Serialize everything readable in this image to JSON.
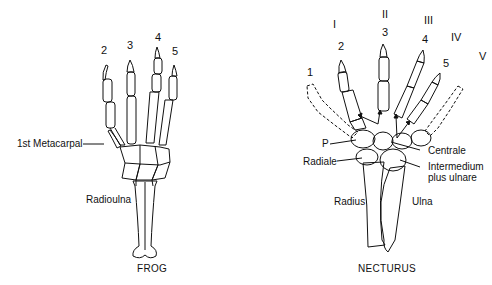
{
  "frog": {
    "caption": "FROG",
    "digit_numbers": [
      "2",
      "3",
      "4",
      "5"
    ],
    "labels": {
      "first_metacarpal": "1st Metacarpal",
      "radioulna": "Radioulna"
    }
  },
  "necturus": {
    "caption": "NECTURUS",
    "digit_numbers": [
      "1",
      "2",
      "3",
      "4",
      "5"
    ],
    "roman_numerals": [
      "I",
      "II",
      "III",
      "IV",
      "V"
    ],
    "labels": {
      "p": "P",
      "radiale": "Radiale",
      "centrale": "Centrale",
      "intermedium_line1": "Intermedium",
      "intermedium_line2": "plus ulnare",
      "radius": "Radius",
      "ulna": "Ulna"
    }
  }
}
